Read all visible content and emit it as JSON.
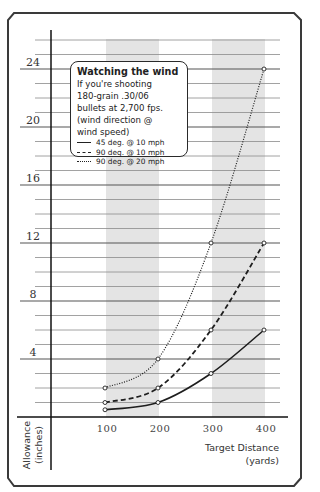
{
  "chart_data": {
    "type": "line",
    "title": "Watching the wind",
    "subtitle": "If you're shooting 180-grain .30/06 bullets at 2,700 fps. (wind direction @ wind speed)",
    "xlabel": "Target Distance (yards)",
    "ylabel": "Allowance (inches)",
    "x": [
      100,
      200,
      300,
      400
    ],
    "x_tick_labels": [
      "100",
      "200",
      "300",
      "400"
    ],
    "y_tick_labels": [
      "4",
      "8",
      "12",
      "16",
      "20",
      "24"
    ],
    "ylim": [
      0,
      26
    ],
    "grid": true,
    "shaded_bands": [
      [
        100,
        200
      ],
      [
        300,
        400
      ]
    ],
    "legend_position": "upper-left inset",
    "series": [
      {
        "name": "45 deg. @ 10 mph",
        "style": "solid",
        "values": [
          0.5,
          1,
          3,
          6
        ]
      },
      {
        "name": "90 deg. @ 10 mph",
        "style": "dashed",
        "values": [
          1,
          2,
          6,
          12
        ]
      },
      {
        "name": "90 deg. @ 20 mph",
        "style": "dotted",
        "values": [
          2,
          4,
          12,
          24
        ]
      }
    ]
  },
  "legend": {
    "title": "Watching the wind",
    "body": "If you're shooting\n180-grain .30/06\nbullets at 2,700 fps.\n(wind direction @\nwind speed)",
    "items": [
      {
        "label": "45 deg. @ 10 mph"
      },
      {
        "label": "90 deg. @ 10 mph"
      },
      {
        "label": "90 deg. @ 20 mph"
      }
    ]
  },
  "axes": {
    "y_label_line1": "Allowance",
    "y_label_line2": "(inches)",
    "x_label_line1": "Target Distance",
    "x_label_line2": "(yards)"
  },
  "colors": {
    "frame": "#3a3a3a",
    "grid": "#8a8a8a",
    "band": "#e4e4e4",
    "line": "#1e1e1e"
  }
}
